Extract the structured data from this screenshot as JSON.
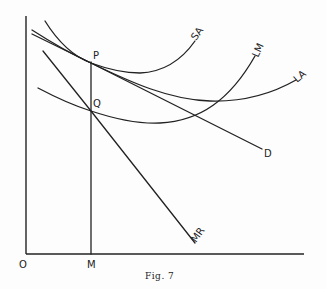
{
  "figure": {
    "caption": "Fig. 7",
    "origin_label": "O",
    "x_point_label": "M",
    "points": [
      {
        "label": "P",
        "description": "tangency of SA, LA and D above M"
      },
      {
        "label": "Q",
        "description": "intersection of LM and MR above M"
      }
    ],
    "curves": [
      {
        "label": "SA",
        "kind": "U-shaped curve, short-run average cost"
      },
      {
        "label": "LA",
        "kind": "U-shaped curve, long-run average cost"
      },
      {
        "label": "D",
        "kind": "straight downward-sloping demand line"
      },
      {
        "label": "LM",
        "kind": "U-shaped curve, long-run marginal cost"
      },
      {
        "label": "MR",
        "kind": "straight downward-sloping marginal revenue line"
      }
    ],
    "colors": {
      "ink": "#222222",
      "paper": "#fdfdfd"
    }
  },
  "labels": {
    "SA": "SA",
    "LA": "LA",
    "D": "D",
    "LM": "LM",
    "MR": "MR",
    "P": "P",
    "Q": "Q",
    "O": "O",
    "M": "M",
    "caption": "Fig. 7"
  }
}
